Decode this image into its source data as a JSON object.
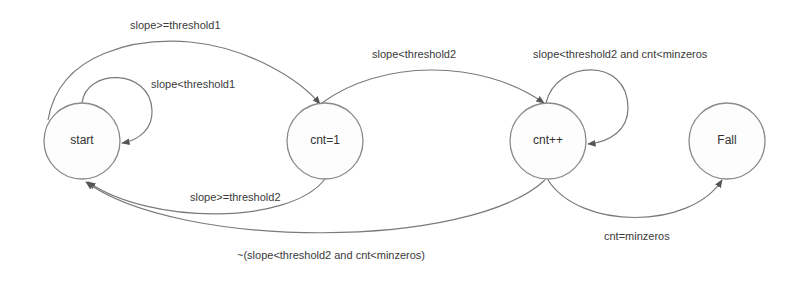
{
  "diagram": {
    "type": "state-machine",
    "colors": {
      "background": "#ffffff",
      "node_stroke": "#8a8a8a",
      "edge_stroke": "#7a7a7a",
      "text": "#3a3a3a"
    },
    "nodes": [
      {
        "id": "start",
        "label": "start"
      },
      {
        "id": "cnt1",
        "label": "cnt=1"
      },
      {
        "id": "cntpp",
        "label": "cnt++"
      },
      {
        "id": "fail",
        "label": "Fall"
      }
    ],
    "edges": [
      {
        "from": "start",
        "to": "start",
        "label": "slope<threshold1"
      },
      {
        "from": "start",
        "to": "cnt1",
        "label": "slope>=threshold1"
      },
      {
        "from": "cnt1",
        "to": "cntpp",
        "label": "slope<threshold2"
      },
      {
        "from": "cntpp",
        "to": "cntpp",
        "label": "slope<threshold2 and cnt<minzeros"
      },
      {
        "from": "cnt1",
        "to": "start",
        "label": "slope>=threshold2"
      },
      {
        "from": "cntpp",
        "to": "start",
        "label": "~(slope<threshold2 and cnt<minzeros)"
      },
      {
        "from": "cntpp",
        "to": "fail",
        "label": "cnt=minzeros"
      }
    ]
  }
}
